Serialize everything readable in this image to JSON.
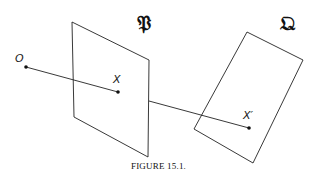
{
  "diagram": {
    "planes": [
      {
        "name": "P",
        "label": "𝔓",
        "corners": [
          [
            72,
            22
          ],
          [
            149,
            60
          ],
          [
            148,
            157
          ],
          [
            74,
            117
          ]
        ]
      },
      {
        "name": "Q",
        "label": "𝔔",
        "corners": [
          [
            247,
            32
          ],
          [
            303,
            60
          ],
          [
            253,
            163
          ],
          [
            194,
            129
          ]
        ]
      }
    ],
    "points": [
      {
        "name": "O",
        "label": "O",
        "x": 26,
        "y": 67
      },
      {
        "name": "X",
        "label": "X",
        "x": 118,
        "y": 92
      },
      {
        "name": "X'",
        "label": "X′",
        "x": 249,
        "y": 128
      }
    ],
    "caption": "FIGURE 15.1."
  }
}
